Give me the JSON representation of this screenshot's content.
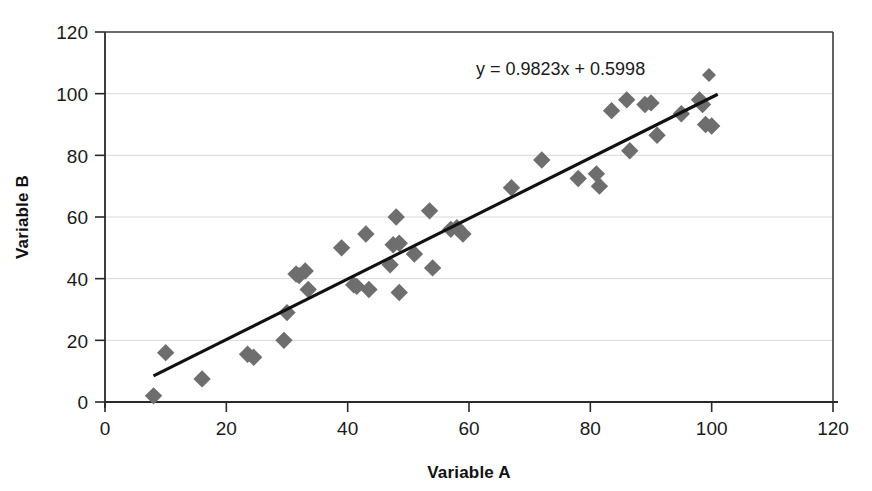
{
  "chart_data": {
    "type": "scatter",
    "title": "",
    "xlabel": "Variable A",
    "ylabel": "Variable B",
    "xlim": [
      0,
      120
    ],
    "ylim": [
      0,
      120
    ],
    "xticks": [
      0,
      20,
      40,
      60,
      80,
      100,
      120
    ],
    "yticks": [
      0,
      20,
      40,
      60,
      80,
      100,
      120
    ],
    "grid": "horizontal",
    "legend": "none",
    "annotations": [
      {
        "name": "trendline-equation",
        "text": "y = 0.9823x + 0.5998",
        "x": 63,
        "y": 107
      }
    ],
    "trendline": {
      "type": "linear",
      "slope": 0.9823,
      "intercept": 0.5998,
      "equation": "y = 0.9823x + 0.5998",
      "x_start": 8,
      "x_end": 101,
      "color": "#111111"
    },
    "marker": {
      "shape": "diamond",
      "color": "#6e6e6e",
      "size": 11
    },
    "points": [
      {
        "x": 8,
        "y": 2
      },
      {
        "x": 10,
        "y": 16
      },
      {
        "x": 16,
        "y": 7.5
      },
      {
        "x": 23.5,
        "y": 15.5
      },
      {
        "x": 24.5,
        "y": 14.5
      },
      {
        "x": 29.5,
        "y": 20
      },
      {
        "x": 30,
        "y": 29
      },
      {
        "x": 31.5,
        "y": 41.5
      },
      {
        "x": 32,
        "y": 41
      },
      {
        "x": 33,
        "y": 42.5
      },
      {
        "x": 33.5,
        "y": 36.5
      },
      {
        "x": 39,
        "y": 50
      },
      {
        "x": 41,
        "y": 38
      },
      {
        "x": 41.5,
        "y": 37.5
      },
      {
        "x": 43,
        "y": 54.5
      },
      {
        "x": 43.5,
        "y": 36.5
      },
      {
        "x": 47,
        "y": 44.5
      },
      {
        "x": 47.5,
        "y": 51
      },
      {
        "x": 48,
        "y": 60
      },
      {
        "x": 48.5,
        "y": 51.5
      },
      {
        "x": 48.5,
        "y": 35.5
      },
      {
        "x": 51,
        "y": 48
      },
      {
        "x": 53.5,
        "y": 62
      },
      {
        "x": 54,
        "y": 43.5
      },
      {
        "x": 57,
        "y": 56
      },
      {
        "x": 58,
        "y": 56.5
      },
      {
        "x": 59,
        "y": 54.5
      },
      {
        "x": 67,
        "y": 69.5
      },
      {
        "x": 72,
        "y": 78.5
      },
      {
        "x": 78,
        "y": 72.5
      },
      {
        "x": 81,
        "y": 74
      },
      {
        "x": 81.5,
        "y": 70
      },
      {
        "x": 83.5,
        "y": 94.5
      },
      {
        "x": 86,
        "y": 98
      },
      {
        "x": 86.5,
        "y": 81.5
      },
      {
        "x": 89,
        "y": 96.5
      },
      {
        "x": 90,
        "y": 97
      },
      {
        "x": 91,
        "y": 86.5
      },
      {
        "x": 95,
        "y": 93.5
      },
      {
        "x": 98,
        "y": 98
      },
      {
        "x": 98.5,
        "y": 96.5
      },
      {
        "x": 99,
        "y": 90
      },
      {
        "x": 100,
        "y": 89.5
      }
    ]
  },
  "labels": {
    "x_axis_title": "Variable A",
    "y_axis_title": "Variable B",
    "equation": "y = 0.9823x + 0.5998",
    "tick_0": "0",
    "tick_20": "20",
    "tick_40": "40",
    "tick_60": "60",
    "tick_80": "80",
    "tick_100": "100",
    "tick_120": "120"
  },
  "colors": {
    "marker": "#6e6e6e",
    "trendline": "#111111",
    "gridline": "#d9d9d9",
    "axis": "#2a2a2a",
    "background": "#ffffff"
  }
}
